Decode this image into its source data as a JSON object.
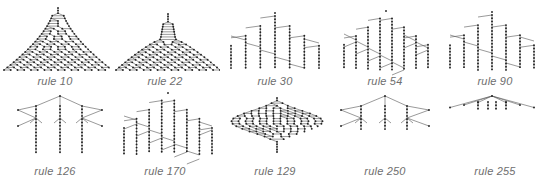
{
  "figure": {
    "panels": [
      {
        "label": "rule 10",
        "x": 0,
        "y": 0,
        "shape": "dense-dome",
        "cx": 58,
        "top": 8,
        "bottom": 70,
        "halfwidth": 50,
        "density": 14
      },
      {
        "label": "rule 22",
        "x": 110,
        "y": 0,
        "shape": "spire-fan",
        "cx": 58,
        "top": 14,
        "bottom": 70,
        "halfwidth": 45,
        "density": 9
      },
      {
        "label": "rule 30",
        "x": 220,
        "y": 0,
        "shape": "stepped",
        "cx": 55,
        "top": 16,
        "bottom": 70,
        "halfwidth": 44,
        "density": 7
      },
      {
        "label": "rule 54",
        "x": 330,
        "y": 0,
        "shape": "braided",
        "cx": 56,
        "top": 14,
        "bottom": 70,
        "halfwidth": 42,
        "density": 8
      },
      {
        "label": "rule 90",
        "x": 440,
        "y": 0,
        "shape": "stepped",
        "cx": 52,
        "top": 15,
        "bottom": 70,
        "halfwidth": 42,
        "density": 7
      },
      {
        "label": "rule 126",
        "x": 0,
        "y": 90,
        "shape": "zigzag",
        "cx": 60,
        "top": 6,
        "bottom": 64,
        "halfwidth": 42,
        "density": 5
      },
      {
        "label": "rule 170",
        "x": 110,
        "y": 90,
        "shape": "stepped-wide",
        "cx": 58,
        "top": 6,
        "bottom": 64,
        "halfwidth": 44,
        "density": 8
      },
      {
        "label": "rule 129",
        "x": 220,
        "y": 90,
        "shape": "spindle",
        "cx": 57,
        "top": 8,
        "bottom": 62,
        "halfwidth": 44,
        "density": 14
      },
      {
        "label": "rule 250",
        "x": 330,
        "y": 90,
        "shape": "zigzag-short",
        "cx": 55,
        "top": 6,
        "bottom": 40,
        "halfwidth": 44,
        "density": 5
      },
      {
        "label": "rule 255",
        "x": 440,
        "y": 90,
        "shape": "fan-flat",
        "cx": 52,
        "top": 6,
        "bottom": 20,
        "halfwidth": 43,
        "density": 7
      }
    ]
  }
}
